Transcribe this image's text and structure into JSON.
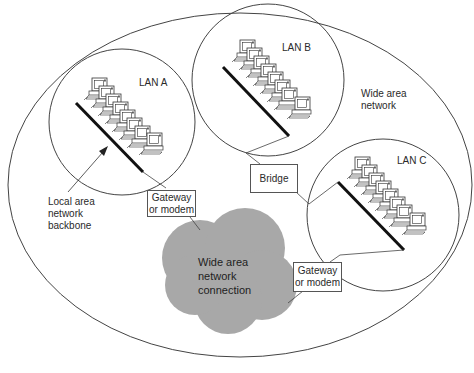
{
  "diagram": {
    "type": "network-topology",
    "wan_label": [
      "Wide area",
      "network"
    ],
    "cloud_label": [
      "Wide area",
      "network",
      "connection"
    ],
    "lans": [
      {
        "id": "lan-a",
        "label": "LAN A",
        "computers": 8
      },
      {
        "id": "lan-b",
        "label": "LAN B",
        "computers": 8
      },
      {
        "id": "lan-c",
        "label": "LAN C",
        "computers": 8
      }
    ],
    "backbone_callout": [
      "Local area",
      "network",
      "backbone"
    ],
    "gateway_a": [
      "Gateway",
      "or modem"
    ],
    "gateway_c": [
      "Gateway",
      "or modem"
    ],
    "bridge": "Bridge",
    "colors": {
      "line": "#444444",
      "backbone": "#111111",
      "cloud": "#a6a6a6",
      "background": "#ffffff"
    }
  }
}
